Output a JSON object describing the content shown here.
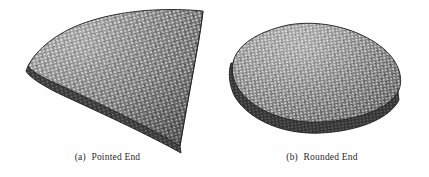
{
  "figure": {
    "background_color": "#fefefe",
    "ink_color": "#2b2b2b",
    "mesh_light_color": "#d9d9d9",
    "mesh_mid_color": "#8c8c8c",
    "mesh_dark_color": "#3a3a3a",
    "mesh_edge_color": "#1c1c1c"
  },
  "panels": [
    {
      "id": "a",
      "tag": "(a)",
      "caption": "Pointed End",
      "caption_full": "(a)  Pointed End",
      "shape_name": "pointed-end-triangulated-surface",
      "shape_description": "fan shaped triangulated surface mesh with a pointed tip at lower right",
      "mesh_type": "triangular",
      "outline_points": "28,66 46,41 78,24 120,14 163,10 203,12 198,42 186,80 178,150 150,133 108,114 66,92",
      "tip_point": "178,150",
      "leftmost_point": "28,66"
    },
    {
      "id": "b",
      "tag": "(b)",
      "caption": "Rounded End",
      "caption_full": "(b)  Rounded End",
      "shape_name": "rounded-end-triangulated-surface",
      "shape_description": "ovoid triangulated surface mesh, rounded at both ends, shown in perspective",
      "mesh_type": "triangular",
      "outline_points": "233,62 240,44 262,31 296,24 334,27 368,41 392,62 400,84 392,104 368,118 330,125 292,120 257,104 237,82",
      "leftmost_point": "233,62",
      "rightmost_point": "400,84"
    }
  ]
}
